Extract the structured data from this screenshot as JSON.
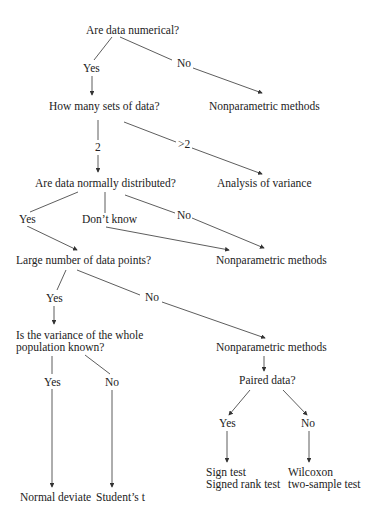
{
  "diagram": {
    "type": "decision-flowchart",
    "nodes": {
      "q_numerical": "Are data numerical?",
      "q_sets": "How many sets of data?",
      "nonparam_1": "Nonparametric methods",
      "q_normal": "Are data normally distributed?",
      "anova": "Analysis of variance",
      "q_large": "Large number of data points?",
      "nonparam_2": "Nonparametric methods",
      "q_variance_line1": "Is the variance of the whole",
      "q_variance_line2": "population known?",
      "nonparam_3": "Nonparametric methods",
      "q_paired": "Paired data?",
      "normal_deviate": "Normal deviate",
      "students_t": "Student’s t",
      "sign_test_line1": "Sign test",
      "sign_test_line2": "Signed rank test",
      "wilcoxon_line1": "Wilcoxon",
      "wilcoxon_line2": "two-sample test"
    },
    "edge_labels": {
      "numerical_yes": "Yes",
      "numerical_no": "No",
      "sets_2": "2",
      "sets_gt2": ">2",
      "normal_yes": "Yes",
      "normal_dontknow": "Don’t know",
      "normal_no": "No",
      "large_yes": "Yes",
      "large_no": "No",
      "variance_yes": "Yes",
      "variance_no": "No",
      "paired_yes": "Yes",
      "paired_no": "No"
    },
    "colors": {
      "line": "#333333",
      "text": "#222222",
      "background": "#ffffff"
    }
  }
}
